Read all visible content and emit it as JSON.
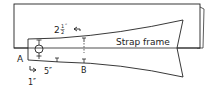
{
  "diagram": {
    "title_label": "Strap frame",
    "point_a": "A",
    "point_b": "B",
    "dim_top": "2",
    "dim_top_frac_num": "1",
    "dim_top_frac_den": "2",
    "dim_top_unit": "″",
    "dim_bottom": "5″",
    "dim_left": "1″",
    "colors": {
      "line": "#222222",
      "background": "#ffffff"
    }
  }
}
